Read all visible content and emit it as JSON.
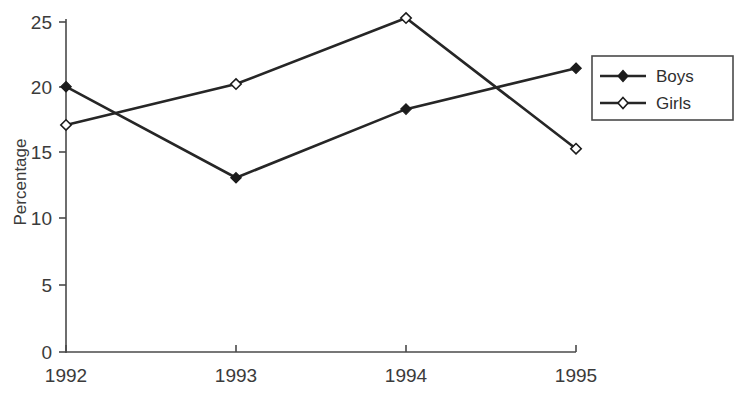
{
  "chart_data": {
    "type": "line",
    "title": "",
    "subtitle": "",
    "xlabel": "",
    "ylabel": "Percentage",
    "categories": [
      "1992",
      "1993",
      "1994",
      "1995"
    ],
    "x": [
      1992,
      1993,
      1994,
      1995
    ],
    "series": [
      {
        "name": "Boys",
        "values": [
          20.1,
          13.2,
          18.4,
          21.5
        ],
        "marker": "filled-diamond",
        "color": "#262626"
      },
      {
        "name": "Girls",
        "values": [
          17.2,
          20.3,
          25.3,
          15.4
        ],
        "marker": "open-diamond",
        "color": "#262626"
      }
    ],
    "ylim": [
      0,
      25
    ],
    "yticks": [
      "0",
      "5",
      "10",
      "15",
      "20",
      "25"
    ],
    "xticks": [
      "1992",
      "1993",
      "1994",
      "1995"
    ],
    "grid": false,
    "legend_position": "right"
  },
  "axes": {
    "y_title": "Percentage",
    "y_tick_labels": [
      "25",
      "20",
      "15",
      "10",
      "5",
      "0"
    ],
    "x_tick_labels": [
      "1992",
      "1993",
      "1994",
      "1995"
    ]
  },
  "legend": {
    "entries": [
      {
        "label": "Boys",
        "marker": "filled-diamond-icon"
      },
      {
        "label": "Girls",
        "marker": "open-diamond-icon"
      }
    ]
  },
  "colors": {
    "line": "#262626",
    "axis": "#4a4a4a",
    "text": "#3b3b3b",
    "background": "#ffffff"
  }
}
